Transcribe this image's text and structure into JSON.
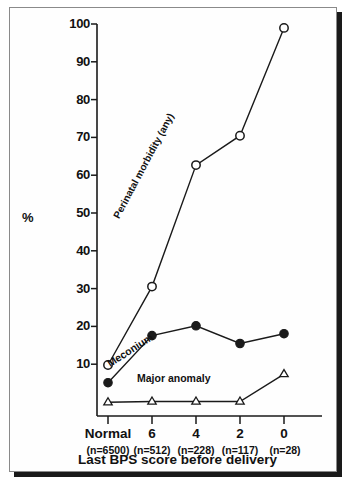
{
  "figure": {
    "axis_y_label": "%",
    "axis_x_title": "Last BPS score before delivery"
  },
  "annotations": {
    "perinatal": "Perinatal morbidity (any)",
    "meconium": "Meconium",
    "anomaly": "Major anomaly"
  },
  "chart_data": {
    "type": "line",
    "title": "",
    "subtitle": "",
    "xlabel": "Last BPS score before delivery",
    "ylabel": "%",
    "categories": [
      "Normal",
      "6",
      "4",
      "2",
      "0"
    ],
    "category_sublabels": [
      "(n=6500)",
      "(n=512)",
      "(n=228)",
      "(n=117)",
      "(n=28)"
    ],
    "sample_sizes": [
      6500,
      512,
      228,
      117,
      28
    ],
    "ylim": [
      0,
      100
    ],
    "yticks": [
      10,
      20,
      30,
      40,
      50,
      60,
      70,
      80,
      90,
      100
    ],
    "grid": false,
    "legend_position": "inline-annotations",
    "series": [
      {
        "name": "Perinatal morbidity (any)",
        "marker": "open-circle",
        "values": [
          13,
          33,
          64,
          71.5,
          99
        ]
      },
      {
        "name": "Meconium",
        "marker": "filled-circle",
        "values": [
          8.5,
          20.5,
          23,
          18.5,
          21
        ]
      },
      {
        "name": "Major anomaly",
        "marker": "open-triangle",
        "values": [
          3.5,
          3.7,
          3.7,
          3.7,
          10.7
        ]
      }
    ]
  },
  "yticks": {
    "t100": "100",
    "t90": "90",
    "t80": "80",
    "t70": "70",
    "t60": "60",
    "t50": "50",
    "t40": "40",
    "t30": "30",
    "t20": "20",
    "t10": "10"
  },
  "xticks": {
    "c0": "Normal",
    "c1": "6",
    "c2": "4",
    "c3": "2",
    "c4": "0",
    "n0": "(n=6500)",
    "n1": "(n=512)",
    "n2": "(n=228)",
    "n3": "(n=117)",
    "n4": "(n=28)"
  }
}
